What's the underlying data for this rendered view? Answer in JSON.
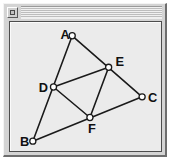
{
  "window": {
    "title": "",
    "menu_button_icon": "window-menu-icon",
    "frame_color": "#d4d4d4",
    "canvas_color": "#ebebeb",
    "border_color": "#4d4d4d"
  },
  "figure": {
    "name": "medial-triangle-diagram",
    "stroke_color": "#1a1a1a",
    "vertex_fill": "#ffffff",
    "viewbox": "0 0 153 131",
    "points": [
      {
        "id": "A",
        "label": "A",
        "x": 63,
        "y": 14,
        "label_x": 51,
        "label_y": 17
      },
      {
        "id": "B",
        "label": "B",
        "x": 23,
        "y": 121,
        "label_x": 10,
        "label_y": 126
      },
      {
        "id": "C",
        "label": "C",
        "x": 134,
        "y": 76,
        "label_x": 140,
        "label_y": 81
      },
      {
        "id": "D",
        "label": "D",
        "x": 44,
        "y": 66,
        "label_x": 29,
        "label_y": 71
      },
      {
        "id": "E",
        "label": "E",
        "x": 100,
        "y": 46,
        "label_x": 107,
        "label_y": 45
      },
      {
        "id": "F",
        "label": "F",
        "x": 81,
        "y": 97,
        "label_x": 79,
        "label_y": 113
      }
    ],
    "edges": [
      {
        "id": "A-B",
        "from": "A",
        "to": "B"
      },
      {
        "id": "B-C",
        "from": "B",
        "to": "C"
      },
      {
        "id": "A-C",
        "from": "A",
        "to": "C"
      },
      {
        "id": "D-E",
        "from": "D",
        "to": "E"
      },
      {
        "id": "E-F",
        "from": "E",
        "to": "F"
      },
      {
        "id": "F-D",
        "from": "F",
        "to": "D"
      }
    ]
  }
}
